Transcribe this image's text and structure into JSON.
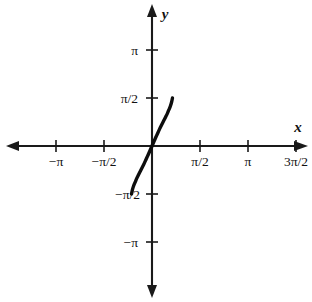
{
  "figure": {
    "kind": "cartesian-plot",
    "background": "#ffffff",
    "ink_color": "#111111",
    "curve_color": "#0d0d0d"
  },
  "axes": {
    "x_label": "x",
    "y_label": "y",
    "origin_px": {
      "x": 152,
      "y": 146
    },
    "pixels_per_half_pi": 48,
    "x_axis": {
      "start_px": 8,
      "end_px": 306,
      "arrows": [
        "left",
        "right"
      ]
    },
    "y_axis": {
      "start_px": 5,
      "end_px": 296,
      "arrows": [
        "up",
        "down"
      ]
    }
  },
  "x_ticks": [
    {
      "label": "−π",
      "value": -3.14159,
      "px": 56
    },
    {
      "label": "−π/2",
      "value": -1.5708,
      "px": 104
    },
    {
      "label": "π/2",
      "value": 1.5708,
      "px": 200
    },
    {
      "label": "π",
      "value": 3.14159,
      "px": 248
    },
    {
      "label": "3π/2",
      "value": 4.71239,
      "px": 296
    }
  ],
  "y_ticks": [
    {
      "label": "π",
      "value": 3.14159,
      "px": 50
    },
    {
      "label": "π/2",
      "value": 1.5708,
      "px": 98
    },
    {
      "label": "−π/2",
      "value": -1.5708,
      "px": 194
    },
    {
      "label": "−π",
      "value": -3.14159,
      "px": 242
    }
  ],
  "chart_data": {
    "type": "line",
    "title": "",
    "xlabel": "x",
    "ylabel": "y",
    "xlim": [
      -3.6,
      5.2
    ],
    "ylim": [
      -3.6,
      3.6
    ],
    "grid": false,
    "legend": "none",
    "series": [
      {
        "name": "y = arcsin(x)",
        "x": [
          -0.67,
          -0.64,
          -0.6,
          -0.55,
          -0.5,
          -0.45,
          -0.4,
          -0.35,
          -0.3,
          -0.25,
          -0.2,
          -0.15,
          -0.1,
          -0.05,
          0.0,
          0.05,
          0.1,
          0.15,
          0.2,
          0.25,
          0.3,
          0.35,
          0.4,
          0.45,
          0.5,
          0.55,
          0.6,
          0.64,
          0.67
        ],
        "y": [
          -1.571,
          -1.43,
          -1.3,
          -1.18,
          -1.06,
          -0.96,
          -0.86,
          -0.76,
          -0.66,
          -0.56,
          -0.45,
          -0.34,
          -0.23,
          -0.115,
          0.0,
          0.115,
          0.23,
          0.34,
          0.45,
          0.56,
          0.66,
          0.76,
          0.86,
          0.96,
          1.06,
          1.18,
          1.3,
          1.43,
          1.571
        ],
        "endpoints": {
          "lower_px": {
            "x": 120,
            "y": 191
          },
          "upper_px": {
            "x": 185,
            "y": 100
          }
        }
      }
    ]
  }
}
